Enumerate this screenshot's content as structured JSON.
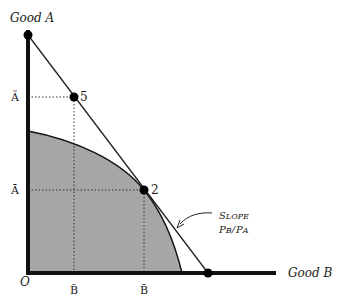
{
  "diagram": {
    "axes": {
      "y_label": "Good A",
      "x_label": "Good B",
      "origin_label": "O"
    },
    "y_ticks": [
      {
        "label": "Ã",
        "note": "A with tilde"
      },
      {
        "label": "Ā",
        "note": "A with bar"
      }
    ],
    "x_ticks": [
      {
        "label": "B̃",
        "note": "B with tilde"
      },
      {
        "label": "B̄",
        "note": "B with bar"
      }
    ],
    "points": [
      {
        "label": "5",
        "desc": "consumption point on trade line"
      },
      {
        "label": "2",
        "desc": "production point tangent to PPF"
      }
    ],
    "annotation": {
      "line1_initial": "S",
      "line1_rest": "LOPE",
      "line2_pb": "P",
      "line2_pb_sub": "B",
      "line2_slash": "/",
      "line2_pa": "P",
      "line2_pa_sub": "A"
    },
    "colors": {
      "ppf_fill": "#a6a6a6",
      "axis": "#111111",
      "line": "#222222",
      "dotted": "#333333"
    }
  }
}
